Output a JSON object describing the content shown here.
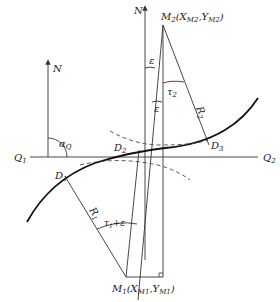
{
  "labels": {
    "n_left": "N",
    "n_center": "N",
    "alpha_q": "α",
    "alpha_q_sub": "Q",
    "q1": "Q",
    "q1_sub": "1",
    "q2": "Q",
    "q2_sub": "2",
    "d1": "D",
    "d1_sub": "1",
    "d2": "D",
    "d2_sub": "2",
    "d3": "D",
    "d3_sub": "3",
    "m2": "M",
    "m2_sub": "2",
    "m2_coords": "(X",
    "m2_x_sub": "M2",
    "m2_comma": ",Y",
    "m2_y_sub": "M2",
    "m2_close": ")",
    "m1": "M",
    "m1_sub": "1",
    "m1_coords": "(X",
    "m1_x_sub": "M1",
    "m1_comma": ",Y",
    "m1_y_sub": "M1",
    "m1_close": ")",
    "epsilon_top": "ε",
    "epsilon_mid": "ε",
    "tau2": "τ",
    "tau2_sub": "2",
    "r2": "R",
    "r2_sub": "2",
    "r1": "R",
    "r1_sub": "1",
    "tau1_eps": "τ",
    "tau1_eps_sub": "1",
    "tau1_eps_plus": "+ε"
  },
  "colors": {
    "line": "#333333",
    "curve": "#111111",
    "dashed": "#444444"
  }
}
